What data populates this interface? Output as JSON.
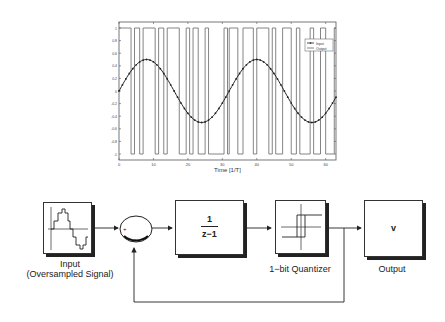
{
  "chart_data": {
    "type": "line",
    "title": "",
    "xlabel": "Time  [1/T]",
    "ylabel": "",
    "xlim": [
      0,
      63
    ],
    "ylim": [
      -1.05,
      1.05
    ],
    "xticks": [
      "0",
      "10",
      "20",
      "30",
      "40",
      "50",
      "60"
    ],
    "yticks": [
      "1",
      "0.8",
      "0.6",
      "0.4",
      "0.2",
      "0",
      "-0.2",
      "-0.4",
      "-0.6",
      "-0.8",
      "-1"
    ],
    "grid": false,
    "legend_position": "upper right",
    "legend": [
      "Input",
      "Output"
    ],
    "series": [
      {
        "name": "Input",
        "type": "sine",
        "amplitude": 0.5,
        "period": 32,
        "phase_start": 0,
        "marker": "dot"
      },
      {
        "name": "Output",
        "type": "square",
        "levels": [
          -1,
          1
        ],
        "segments_x": [
          [
            0,
            3.5,
            1
          ],
          [
            3.5,
            4.5,
            -1
          ],
          [
            4.5,
            6,
            1
          ],
          [
            6,
            7,
            -1
          ],
          [
            7,
            10.5,
            1
          ],
          [
            10.5,
            11.5,
            -1
          ],
          [
            11.5,
            13,
            1
          ],
          [
            13,
            14,
            -1
          ],
          [
            14,
            17.5,
            1
          ],
          [
            17.5,
            19.5,
            -1
          ],
          [
            19.5,
            20.5,
            1
          ],
          [
            20.5,
            21.5,
            -1
          ],
          [
            21.5,
            23,
            1
          ],
          [
            23,
            25,
            -1
          ],
          [
            25,
            26,
            1
          ],
          [
            26,
            30.5,
            -1
          ],
          [
            30.5,
            31.5,
            1
          ],
          [
            31.5,
            32,
            -1
          ],
          [
            32,
            34.5,
            1
          ],
          [
            34.5,
            36,
            -1
          ],
          [
            36,
            39,
            1
          ],
          [
            39,
            40,
            -1
          ],
          [
            40,
            43.5,
            1
          ],
          [
            43.5,
            44.5,
            -1
          ],
          [
            44.5,
            45.5,
            1
          ],
          [
            45.5,
            47.5,
            -1
          ],
          [
            47.5,
            50,
            1
          ],
          [
            50,
            51.5,
            -1
          ],
          [
            51.5,
            52.5,
            1
          ],
          [
            52.5,
            55.5,
            -1
          ],
          [
            55.5,
            56.5,
            1
          ],
          [
            56.5,
            58.5,
            -1
          ],
          [
            58.5,
            60,
            1
          ],
          [
            60,
            62.5,
            -1
          ],
          [
            62.5,
            63,
            1
          ]
        ]
      }
    ]
  },
  "diagram": {
    "blocks": {
      "input": {
        "label_line1": "Input",
        "label_line2": "(Oversampled Signal)"
      },
      "sum": {
        "plus": "+",
        "minus": "-"
      },
      "integrator": {
        "numerator": "1",
        "denominator": "z−1"
      },
      "quantizer": {
        "label": "1−bit Quantizer"
      },
      "output": {
        "value": "v",
        "label": "Output"
      }
    }
  }
}
